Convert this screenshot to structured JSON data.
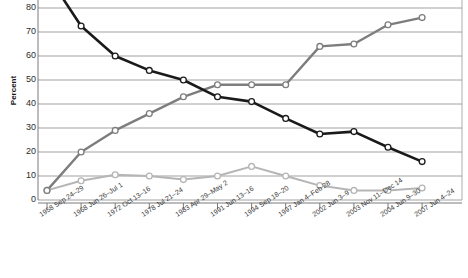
{
  "chart": {
    "ylabel": "Percent",
    "ytick_labels": [
      "80",
      "70",
      "60",
      "50",
      "40",
      "30",
      "20",
      "10",
      "0"
    ]
  },
  "chart_data": {
    "type": "line",
    "title": "",
    "xlabel": "",
    "ylabel": "Percent",
    "ylim": [
      0,
      85
    ],
    "yticks": [
      0,
      10,
      20,
      30,
      40,
      50,
      60,
      70,
      80
    ],
    "grid": true,
    "legend": "none",
    "categories": [
      "1958 Sep 24–29",
      "1968 Jun 26–Jul 1",
      "1972 Oct 13–16",
      "1978 Jul 21–24",
      "1983 Apr 29–May 2",
      "1991 Jun 13–16",
      "1994 Sep 18–20",
      "1997 Jan 4–Feb 28",
      "2002 Jun 3–9",
      "2003 Nov 11–Dec 14",
      "2004 Jun 9–30",
      "2007 Jun 4–24"
    ],
    "series": [
      {
        "name": "Disapprove",
        "color": "#1a1a1a",
        "values": [
          94,
          72.5,
          60,
          54,
          50,
          43,
          41,
          34,
          27.5,
          28.5,
          22,
          16
        ]
      },
      {
        "name": "Approve",
        "color": "#7d7d7d",
        "values": [
          4,
          20,
          29,
          36,
          43,
          48,
          48,
          48,
          64,
          65,
          73,
          76
        ]
      },
      {
        "name": "No opinion",
        "color": "#b5b5b5",
        "values": [
          4,
          8,
          10.5,
          10,
          8.5,
          10,
          14,
          10,
          6,
          4,
          4,
          5
        ]
      }
    ]
  }
}
